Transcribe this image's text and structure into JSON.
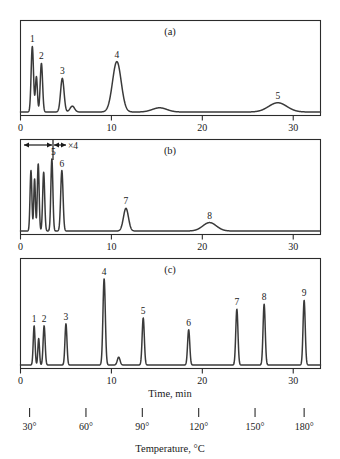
{
  "figure": {
    "time_axis_title": "Time, min",
    "temperature_axis_title": "Temperature, °C",
    "time_ticks": [
      "0",
      "10",
      "20",
      "30"
    ],
    "temperature_ticks": [
      "30°",
      "60°",
      "90°",
      "120°",
      "150°",
      "180°"
    ],
    "trace_color": "#3a3a3a",
    "frame_color": "#2b2b2b"
  },
  "panels": {
    "a": {
      "tag": "(a)",
      "peak_labels": [
        "1",
        "2",
        "3",
        "4",
        "5"
      ]
    },
    "b": {
      "tag": "(b)",
      "peak_labels": [
        "5",
        "6",
        "7",
        "8"
      ],
      "scale_annotation": "×4"
    },
    "c": {
      "tag": "(c)",
      "peak_labels": [
        "1",
        "2",
        "3",
        "4",
        "5",
        "6",
        "7",
        "8",
        "9"
      ]
    }
  },
  "chart_data": {
    "type": "line",
    "title": "",
    "xlabel": "Time, min",
    "ylabel": "",
    "xlim": [
      0,
      33
    ],
    "secondary_xaxis": {
      "label": "Temperature, °C",
      "ticks": [
        30,
        60,
        90,
        120,
        150,
        180
      ],
      "tick_labels": [
        "30°",
        "60°",
        "90°",
        "120°",
        "150°",
        "180°"
      ],
      "tick_times": [
        1.0,
        7.2,
        13.4,
        19.6,
        25.8,
        31.2
      ]
    },
    "grid": false,
    "legend": "none",
    "time_ticks": [
      0,
      10,
      20,
      30
    ],
    "panels": [
      {
        "name": "(a)",
        "peaks": [
          {
            "label": "1",
            "time": 1.3,
            "height": 0.78,
            "width": 0.26
          },
          {
            "label": "",
            "time": 1.75,
            "height": 0.42,
            "width": 0.22
          },
          {
            "label": "2",
            "time": 2.3,
            "height": 0.58,
            "width": 0.26
          },
          {
            "label": "3",
            "time": 4.6,
            "height": 0.4,
            "width": 0.38
          },
          {
            "label": "",
            "time": 5.7,
            "height": 0.07,
            "width": 0.5
          },
          {
            "label": "4",
            "time": 10.6,
            "height": 0.6,
            "width": 0.95
          },
          {
            "label": "",
            "time": 15.3,
            "height": 0.05,
            "width": 1.6
          },
          {
            "label": "5",
            "time": 28.3,
            "height": 0.11,
            "width": 2.0
          }
        ]
      },
      {
        "name": "(b)",
        "scale_annotation": "×4",
        "peaks": [
          {
            "label": "",
            "time": 1.15,
            "height": 0.72,
            "width": 0.2
          },
          {
            "label": "",
            "time": 1.55,
            "height": 0.62,
            "width": 0.18
          },
          {
            "label": "",
            "time": 1.95,
            "height": 0.8,
            "width": 0.2
          },
          {
            "label": "",
            "time": 2.55,
            "height": 0.7,
            "width": 0.22
          },
          {
            "label": "5",
            "time": 3.45,
            "height": 0.86,
            "width": 0.22
          },
          {
            "label": "6",
            "time": 4.55,
            "height": 0.72,
            "width": 0.26
          },
          {
            "label": "7",
            "time": 11.6,
            "height": 0.27,
            "width": 0.55
          },
          {
            "label": "8",
            "time": 20.8,
            "height": 0.1,
            "width": 1.5
          }
        ]
      },
      {
        "name": "(c)",
        "peaks": [
          {
            "label": "1",
            "time": 1.5,
            "height": 0.4,
            "width": 0.2
          },
          {
            "label": "",
            "time": 2.0,
            "height": 0.27,
            "width": 0.18
          },
          {
            "label": "2",
            "time": 2.6,
            "height": 0.4,
            "width": 0.22
          },
          {
            "label": "3",
            "time": 5.0,
            "height": 0.42,
            "width": 0.22
          },
          {
            "label": "4",
            "time": 9.2,
            "height": 0.88,
            "width": 0.26
          },
          {
            "label": "",
            "time": 10.8,
            "height": 0.08,
            "width": 0.3
          },
          {
            "label": "5",
            "time": 13.5,
            "height": 0.48,
            "width": 0.24
          },
          {
            "label": "6",
            "time": 18.5,
            "height": 0.36,
            "width": 0.24
          },
          {
            "label": "7",
            "time": 23.8,
            "height": 0.57,
            "width": 0.24
          },
          {
            "label": "8",
            "time": 26.8,
            "height": 0.62,
            "width": 0.24
          },
          {
            "label": "9",
            "time": 31.2,
            "height": 0.66,
            "width": 0.24
          }
        ]
      }
    ]
  }
}
